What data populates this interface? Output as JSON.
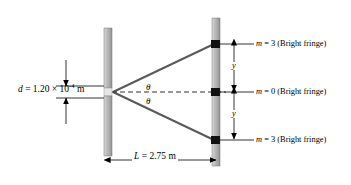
{
  "diagram": {
    "slit_separation_label": {
      "symbol": "d",
      "equals": " = 1.20 × 10",
      "exponent": "-4",
      "unit": " m",
      "full_text": "d = 1.20 × 10^-4 m"
    },
    "screen_distance_label": {
      "symbol": "L",
      "value": " = 2.75 m",
      "full_text": "L = 2.75 m"
    },
    "angle_labels": [
      {
        "name": "theta-upper",
        "text": "θ"
      },
      {
        "name": "theta-lower",
        "text": "θ"
      }
    ],
    "fringe_labels": [
      {
        "name": "fringe-top",
        "symbol": "m",
        "text": " = 3 (Bright fringe)",
        "order": 3
      },
      {
        "name": "fringe-center",
        "symbol": "m",
        "text": " = 0 (Bright fringe)",
        "order": 0
      },
      {
        "name": "fringe-bottom",
        "symbol": "m",
        "text": " = 3 (Bright fringe)",
        "order": 3
      }
    ],
    "fringe_spacing_labels": [
      {
        "name": "y-upper",
        "text": "y"
      },
      {
        "name": "y-lower",
        "text": "y"
      }
    ],
    "colors": {
      "bar_fill": "#b3b3b3",
      "bar_highlight": "#d9d9d9",
      "bar_shadow": "#8c8c8c",
      "ray": "#595959",
      "marker": "#111111",
      "dimension_line": "#000000",
      "background": "#ffffff"
    }
  }
}
